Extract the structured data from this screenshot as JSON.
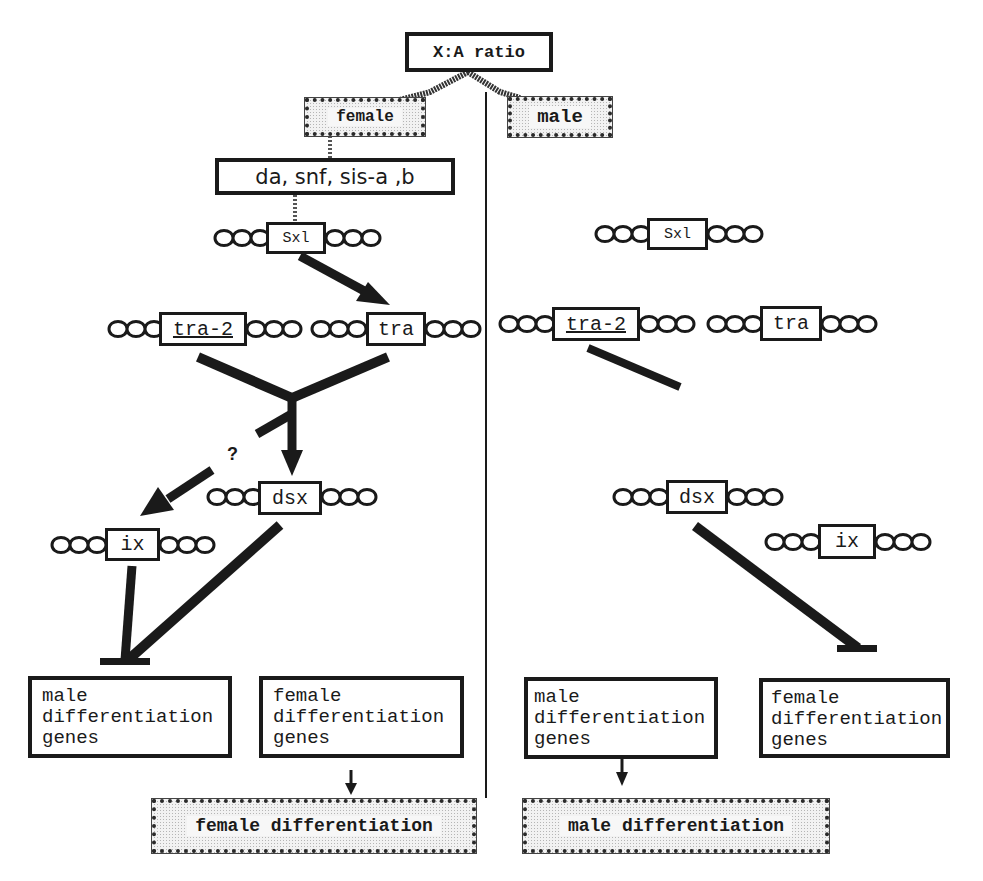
{
  "diagram": {
    "type": "sex-determination regulatory pathway",
    "root": {
      "label": "X:A ratio"
    },
    "branches": {
      "female": {
        "label": "female"
      },
      "male": {
        "label": "male"
      }
    },
    "female_side": {
      "regulators": {
        "label": "da, snf, sis-a ,b"
      },
      "genes": {
        "sxl": "Sxl",
        "tra2": "tra-2",
        "tra": "tra",
        "dsx": "dsx",
        "ix": "ix"
      },
      "question_mark": "?",
      "target_boxes": {
        "male_genes": "male\ndifferentiation\ngenes",
        "female_genes": "female\ndifferentiation\ngenes"
      },
      "outcome": {
        "label": "female differentiation"
      }
    },
    "male_side": {
      "genes": {
        "sxl": "Sxl",
        "tra2": "tra-2",
        "tra": "tra",
        "dsx": "dsx",
        "ix": "ix"
      },
      "target_boxes": {
        "male_genes": "male\ndifferentiation\ngenes",
        "female_genes": "female\ndifferentiation\ngenes"
      },
      "outcome": {
        "label": "male differentiation"
      }
    },
    "edges": [
      {
        "from": "X:A ratio",
        "to": "female",
        "type": "line"
      },
      {
        "from": "X:A ratio",
        "to": "male",
        "type": "line"
      },
      {
        "from": "female",
        "to": "da, snf, sis-a ,b",
        "type": "line"
      },
      {
        "from": "da, snf, sis-a ,b",
        "to": "Sxl",
        "type": "line"
      },
      {
        "from": "Sxl",
        "to": "tra",
        "type": "activates"
      },
      {
        "from": "tra-2 + tra",
        "to": "dsx",
        "type": "activates"
      },
      {
        "from": "tra-2 + tra",
        "to": "ix",
        "type": "activates",
        "uncertain": true
      },
      {
        "from": "ix",
        "to": "male differentiation genes",
        "type": "represses"
      },
      {
        "from": "dsx",
        "to": "male differentiation genes",
        "type": "represses"
      },
      {
        "from": "female differentiation genes",
        "to": "female differentiation",
        "type": "activates"
      },
      {
        "from": "tra-2 (male)",
        "to": "none",
        "type": "inactive"
      },
      {
        "from": "dsx (male)",
        "to": "female differentiation genes",
        "type": "represses"
      },
      {
        "from": "male differentiation genes",
        "to": "male differentiation",
        "type": "activates"
      }
    ]
  }
}
